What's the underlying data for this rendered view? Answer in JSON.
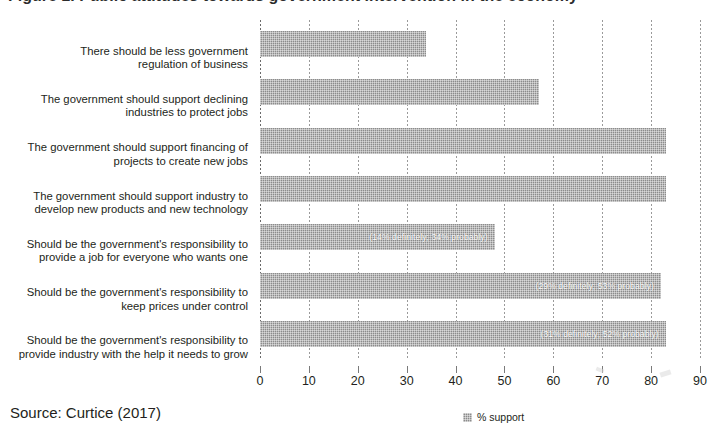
{
  "figure": {
    "title_clipped": "Figure 1. Public attitudes towards government intervention in the economy",
    "source": "Source: Curtice (2017)"
  },
  "legend": {
    "position": "bottom-center",
    "entries": [
      {
        "label": "% support",
        "swatch_name": "legend-swatch-support",
        "color": "#8c8c8c"
      }
    ]
  },
  "axis": {
    "x_ticks": [
      "0",
      "10",
      "20",
      "30",
      "40",
      "50",
      "60",
      "70",
      "80",
      "90"
    ]
  },
  "chart_data": {
    "type": "bar",
    "orientation": "horizontal",
    "title": "Public attitudes towards government intervention in the economy",
    "xlabel": "",
    "ylabel": "",
    "xlim": [
      0,
      90
    ],
    "xtick_step": 10,
    "grid": true,
    "legend_position": "bottom-center",
    "series": [
      {
        "name": "% support",
        "color": "#8c8c8c",
        "values": [
          34,
          57,
          83,
          83,
          48,
          82,
          83
        ]
      }
    ],
    "categories": [
      "There should be less government regulation of business",
      "The government should support declining industries to protect jobs",
      "The government should support financing of projects to create new jobs",
      "The government should support industry to develop new products and new technology",
      "Should be the government's responsibility to provide a job for everyone who wants one",
      "Should be the government's responsibility to keep prices under control",
      "Should be the government's responsibility to provide industry with the help it needs to grow"
    ],
    "annotations": [
      null,
      null,
      null,
      null,
      "(14% definitely; 34% probably)",
      "(29% definitely; 53% probably)",
      "(31% definitely; 52% probably)"
    ]
  },
  "rows": [
    {
      "label_lines": [
        "There should be less government",
        "regulation of business"
      ],
      "value": 34,
      "annotation": ""
    },
    {
      "label_lines": [
        "The government should support declining",
        "industries to protect jobs"
      ],
      "value": 57,
      "annotation": ""
    },
    {
      "label_lines": [
        "The government should support financing of",
        "projects to create new jobs"
      ],
      "value": 83,
      "annotation": ""
    },
    {
      "label_lines": [
        "The government should support industry to",
        "develop new products and new technology"
      ],
      "value": 83,
      "annotation": ""
    },
    {
      "label_lines": [
        "Should be the government's responsibility to",
        "provide a job for everyone who wants one"
      ],
      "value": 48,
      "annotation": "(14% definitely; 34% probably)"
    },
    {
      "label_lines": [
        "Should be the government's responsibility to",
        "keep prices under control"
      ],
      "value": 82,
      "annotation": "(29% definitely; 53% probably)"
    },
    {
      "label_lines": [
        "Should be the government's responsibility to",
        "provide industry with the help it needs to grow"
      ],
      "value": 83,
      "annotation": "(31% definitely; 52% probably)"
    }
  ]
}
